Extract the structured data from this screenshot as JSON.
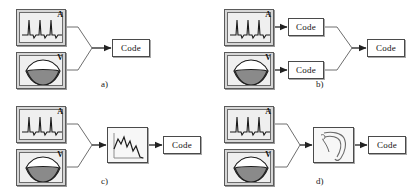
{
  "figure": {
    "colors": {
      "line": "#4a4a4a",
      "box_fill": "#d6d6d6",
      "inner_fill": "#efefef",
      "code_fill": "#ffffff",
      "text": "#111111",
      "shadow": "#a8a8a8",
      "lips_fill": "#8a8a8a"
    },
    "modality_labels": {
      "audio": "A",
      "video": "V"
    },
    "panels": [
      {
        "id": "a",
        "label": "a)",
        "description": "Early fusion: audio and video signals combined directly into a single code",
        "nodes": [
          {
            "name": "audio-signal-box",
            "type": "ecg",
            "tag": "A"
          },
          {
            "name": "video-lips-box",
            "type": "lips",
            "tag": "V"
          },
          {
            "name": "code-box",
            "type": "code",
            "text": "Code"
          }
        ]
      },
      {
        "id": "b",
        "label": "b)",
        "description": "Late fusion: audio and video each coded separately then combined into a joint code",
        "nodes": [
          {
            "name": "audio-signal-box",
            "type": "ecg",
            "tag": "A"
          },
          {
            "name": "video-lips-box",
            "type": "lips",
            "tag": "V"
          },
          {
            "name": "audio-code-box",
            "type": "code",
            "text": "Code"
          },
          {
            "name": "video-code-box",
            "type": "code",
            "text": "Code"
          },
          {
            "name": "joint-code-box",
            "type": "code",
            "text": "Code"
          }
        ]
      },
      {
        "id": "c",
        "label": "c)",
        "description": "Audio and video merged into an intermediate signal representation, then coded",
        "nodes": [
          {
            "name": "audio-signal-box",
            "type": "ecg",
            "tag": "A"
          },
          {
            "name": "video-lips-box",
            "type": "lips",
            "tag": "V"
          },
          {
            "name": "signal-plot-box",
            "type": "waveform"
          },
          {
            "name": "code-box",
            "type": "code",
            "text": "Code"
          }
        ]
      },
      {
        "id": "d",
        "label": "d)",
        "description": "Audio and video merged into an articulatory/vocal-tract model, then coded",
        "nodes": [
          {
            "name": "audio-signal-box",
            "type": "ecg",
            "tag": "A"
          },
          {
            "name": "video-lips-box",
            "type": "lips",
            "tag": "V"
          },
          {
            "name": "vocal-tract-box",
            "type": "tract"
          },
          {
            "name": "code-box",
            "type": "code",
            "text": "Code"
          }
        ]
      }
    ]
  }
}
